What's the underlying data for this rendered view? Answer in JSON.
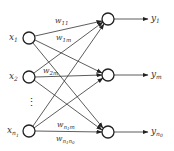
{
  "diagram": {
    "title": "",
    "type": "single-layer neural network",
    "colors": {
      "stroke": "#222222",
      "text": "#333333",
      "background": "#ffffff"
    },
    "inputs": [
      {
        "id": "x1",
        "base": "x",
        "sub": "1",
        "cx": 29,
        "cy": 38
      },
      {
        "id": "x2",
        "base": "x",
        "sub": "2",
        "cx": 29,
        "cy": 77
      },
      {
        "id": "xn1",
        "base": "x",
        "sub": "n",
        "subsub": "1",
        "cx": 29,
        "cy": 131
      }
    ],
    "ellipsis": "⋮",
    "outputs": [
      {
        "id": "y1",
        "base": "y",
        "sub": "1",
        "cx": 108,
        "cy": 19
      },
      {
        "id": "ym",
        "base": "y",
        "sub": "m",
        "cx": 108,
        "cy": 75
      },
      {
        "id": "yn0",
        "base": "y",
        "sub": "n",
        "subsub": "0",
        "cx": 108,
        "cy": 132
      }
    ],
    "weights": [
      {
        "id": "w11",
        "base": "w",
        "sub": "11"
      },
      {
        "id": "w1m",
        "base": "w",
        "sub": "1m"
      },
      {
        "id": "w2m",
        "base": "w",
        "sub": "2m"
      },
      {
        "id": "wn1m",
        "base": "w",
        "sub_a": "n",
        "sub_b": "1",
        "sub_c": "m"
      },
      {
        "id": "wn1n0",
        "base": "w",
        "sub_a": "n",
        "sub_b": "1",
        "sub_c": "n",
        "sub_d": "0"
      }
    ]
  }
}
